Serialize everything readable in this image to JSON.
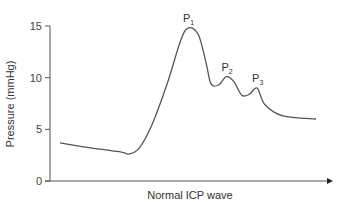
{
  "chart_data": {
    "type": "line",
    "title": "",
    "xlabel": "Normal ICP wave",
    "ylabel": "Pressure (mmHg)",
    "ylim": [
      0,
      15
    ],
    "yticks": [
      0,
      5,
      10,
      15
    ],
    "ytick_labels": [
      "0",
      "5",
      "10",
      "15"
    ],
    "grid": false,
    "legend": null,
    "series": [
      {
        "name": "Normal ICP waveform",
        "color": "#555555",
        "points": [
          {
            "x": 0.0,
            "y": 3.7
          },
          {
            "x": 0.12,
            "y": 3.2
          },
          {
            "x": 0.24,
            "y": 2.8
          },
          {
            "x": 0.27,
            "y": 2.6
          },
          {
            "x": 0.31,
            "y": 3.2
          },
          {
            "x": 0.36,
            "y": 5.5
          },
          {
            "x": 0.42,
            "y": 9.5
          },
          {
            "x": 0.47,
            "y": 13.5
          },
          {
            "x": 0.5,
            "y": 14.8
          },
          {
            "x": 0.54,
            "y": 14.2
          },
          {
            "x": 0.57,
            "y": 11.5
          },
          {
            "x": 0.59,
            "y": 9.4
          },
          {
            "x": 0.62,
            "y": 9.3
          },
          {
            "x": 0.65,
            "y": 10.1
          },
          {
            "x": 0.68,
            "y": 9.6
          },
          {
            "x": 0.71,
            "y": 8.3
          },
          {
            "x": 0.74,
            "y": 8.4
          },
          {
            "x": 0.77,
            "y": 9.0
          },
          {
            "x": 0.8,
            "y": 7.4
          },
          {
            "x": 0.87,
            "y": 6.3
          },
          {
            "x": 1.0,
            "y": 6.0
          }
        ]
      }
    ],
    "annotations": [
      {
        "label": "P",
        "subscript": "1",
        "x": 0.5,
        "y": 14.8,
        "meaning": "percussion wave"
      },
      {
        "label": "P",
        "subscript": "2",
        "x": 0.65,
        "y": 10.1,
        "meaning": "tidal wave"
      },
      {
        "label": "P",
        "subscript": "3",
        "x": 0.77,
        "y": 9.0,
        "meaning": "dicrotic wave"
      }
    ]
  },
  "layout": {
    "plot": {
      "x0": 50,
      "x1": 333,
      "y0": 181,
      "y15": 26
    },
    "curve_x_start": 60,
    "curve_x_end": 316,
    "axis_color": "#555555",
    "curve_color": "#555555"
  }
}
